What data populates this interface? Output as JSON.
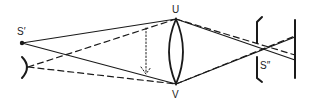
{
  "diagram": {
    "title": "",
    "labels": {
      "source_image": "S′",
      "lens_top": "U",
      "lens_bottom": "V",
      "second_image": "S″"
    },
    "colors": {
      "stroke": "#1a1a1a",
      "background": "#ffffff"
    },
    "elements": [
      "source-point-S-prime",
      "eye",
      "convex-lens-UV",
      "dotted-arrow",
      "aperture-bracket",
      "screen"
    ]
  }
}
